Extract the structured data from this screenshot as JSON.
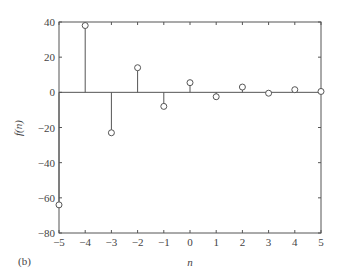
{
  "chart_data": {
    "type": "stem",
    "title": "",
    "panel_label": "(b)",
    "xlabel": "n",
    "ylabel": "f(n)",
    "xlim": [
      -5,
      5
    ],
    "ylim": [
      -80,
      40
    ],
    "xticks": [
      "-5",
      "-4",
      "-3",
      "-2",
      "-1",
      "0",
      "1",
      "2",
      "3",
      "4",
      "5"
    ],
    "yticks": [
      "40",
      "20",
      "0",
      "-20",
      "-40",
      "-60",
      "-80"
    ],
    "grid": false,
    "x": [
      -5,
      -4,
      -3,
      -2,
      -1,
      0,
      1,
      2,
      3,
      4,
      5
    ],
    "values": [
      -64,
      38,
      -23,
      14,
      -8,
      5.5,
      -2.5,
      3,
      -0.5,
      1.5,
      0.5
    ],
    "marker": "open-circle"
  }
}
